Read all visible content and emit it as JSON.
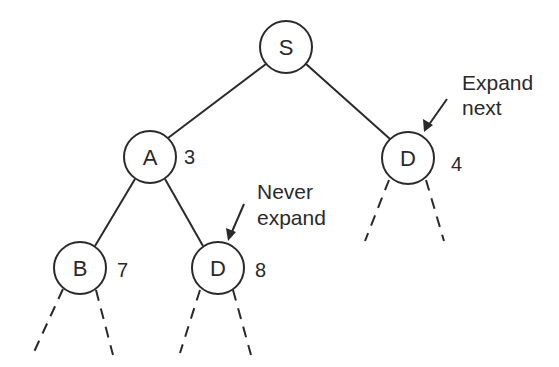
{
  "diagram": {
    "type": "search-tree",
    "nodes": [
      {
        "id": "S",
        "label": "S",
        "cost": null
      },
      {
        "id": "A",
        "label": "A",
        "cost": "3"
      },
      {
        "id": "D1",
        "label": "D",
        "cost": "4"
      },
      {
        "id": "B",
        "label": "B",
        "cost": "7"
      },
      {
        "id": "D2",
        "label": "D",
        "cost": "8"
      }
    ],
    "edges": [
      {
        "from": "S",
        "to": "A"
      },
      {
        "from": "S",
        "to": "D1"
      },
      {
        "from": "A",
        "to": "B"
      },
      {
        "from": "A",
        "to": "D2"
      }
    ],
    "unexpanded_children": [
      "D1",
      "B",
      "D2"
    ],
    "annotations": [
      {
        "target": "D1",
        "lines": [
          "Expand",
          "next"
        ]
      },
      {
        "target": "D2",
        "lines": [
          "Never",
          "expand"
        ]
      }
    ]
  }
}
